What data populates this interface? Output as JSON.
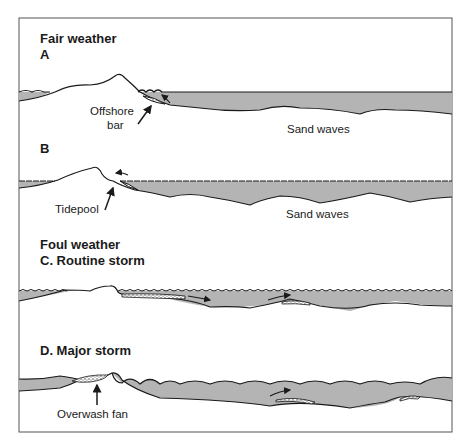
{
  "diagram": {
    "sections": [
      {
        "heading": "Fair weather",
        "panels": [
          {
            "id": "A",
            "title": "A",
            "labels": [
              "Offshore bar",
              "Sand waves"
            ]
          },
          {
            "id": "B",
            "title": "B",
            "labels": [
              "Tidepool",
              "Sand waves"
            ]
          }
        ]
      },
      {
        "heading": "Foul weather",
        "panels": [
          {
            "id": "C",
            "title": "C. Routine storm",
            "labels": []
          },
          {
            "id": "D",
            "title": "D. Major storm",
            "labels": [
              "Overwash fan"
            ]
          }
        ]
      }
    ],
    "text": {
      "fair": "Fair weather",
      "a": "A",
      "offshore1": "Offshore",
      "offshore2": "bar",
      "sandA": "Sand waves",
      "b": "B",
      "tidepool": "Tidepool",
      "sandB": "Sand waves",
      "foul": "Foul weather",
      "c": "C. Routine storm",
      "d": "D. Major storm",
      "overwash": "Overwash fan"
    },
    "colors": {
      "water": "#b4b4b4",
      "line": "#1a1a1a",
      "frame": "#555555"
    }
  }
}
